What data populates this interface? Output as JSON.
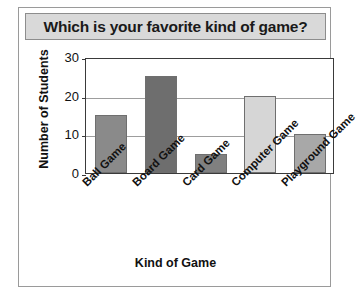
{
  "chart_data": {
    "type": "bar",
    "title": "Which is your favorite kind of game?",
    "xlabel": "Kind of Game",
    "ylabel": "Number of Students",
    "categories": [
      "Ball Game",
      "Board Game",
      "Card Game",
      "Computer Game",
      "Playground Game"
    ],
    "values": [
      15,
      25,
      5,
      20,
      10
    ],
    "bar_colors": [
      "#8a8a8a",
      "#6e6e6e",
      "#808080",
      "#d6d6d6",
      "#a8a8a8"
    ],
    "ylim": [
      0,
      30
    ],
    "yticks": [
      "0",
      "10",
      "20",
      "30"
    ],
    "ytick_values": [
      0,
      10,
      20,
      30
    ],
    "grid": true,
    "legend": false
  },
  "style": {
    "banner_bg": "#d9d9d9",
    "frame_color": "#3a3a3a",
    "grid_color": "#9d9d9d"
  }
}
